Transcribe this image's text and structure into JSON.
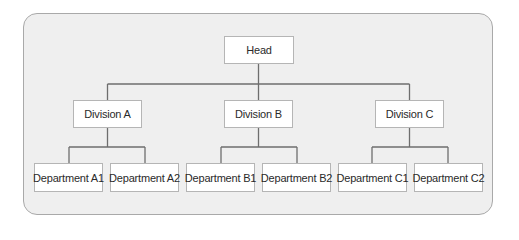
{
  "diagram": {
    "type": "organization-chart",
    "root": {
      "label": "Head",
      "children": [
        {
          "label": "Division A",
          "children": [
            {
              "label": "Department A1"
            },
            {
              "label": "Department A2"
            }
          ]
        },
        {
          "label": "Division B",
          "children": [
            {
              "label": "Department B1"
            },
            {
              "label": "Department B2"
            }
          ]
        },
        {
          "label": "Division C",
          "children": [
            {
              "label": "Department C1"
            },
            {
              "label": "Department C2"
            }
          ]
        }
      ]
    },
    "colors": {
      "background": "#efefef",
      "frame_border": "#a9a9a9",
      "box_fill": "#ffffff",
      "box_border": "#b5b5b5",
      "connector": "#6e6e6e",
      "text": "#2a2a2a"
    }
  }
}
